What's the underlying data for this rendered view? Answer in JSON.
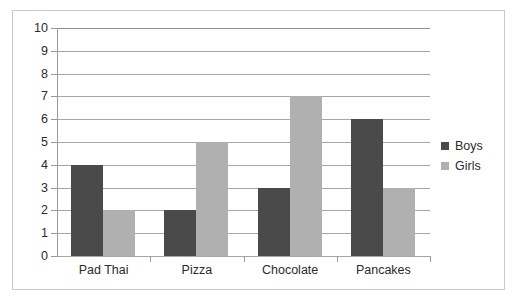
{
  "chart_data": {
    "type": "bar",
    "title": "",
    "subtitle": "",
    "xlabel": "",
    "ylabel": "",
    "categories": [
      "Pad Thai",
      "Pizza",
      "Chocolate",
      "Pancakes"
    ],
    "series": [
      {
        "name": "Boys",
        "color": "#4a4a4a",
        "values": [
          4,
          2,
          3,
          6
        ]
      },
      {
        "name": "Girls",
        "color": "#b0b0b0",
        "values": [
          2,
          5,
          7,
          3
        ]
      }
    ],
    "ylim": [
      0,
      10
    ],
    "ytick_step": 1,
    "ytick_labels": [
      "10",
      "9",
      "8",
      "7",
      "6",
      "5",
      "4",
      "3",
      "2",
      "1",
      "0"
    ],
    "grid": "horizontal",
    "legend_position": "right",
    "annotations": []
  },
  "legend": {
    "entries": [
      {
        "label": "Boys",
        "swatch": "legend-swatch-boys"
      },
      {
        "label": "Girls",
        "swatch": "legend-swatch-girls"
      }
    ]
  },
  "colors": {
    "boys": "#4a4a4a",
    "girls": "#b0b0b0",
    "gridline": "#a6a6a6",
    "axis": "#8f8f8f",
    "frame": "#c9c9c9",
    "background": "#ffffff",
    "text": "#2b2b2b"
  }
}
